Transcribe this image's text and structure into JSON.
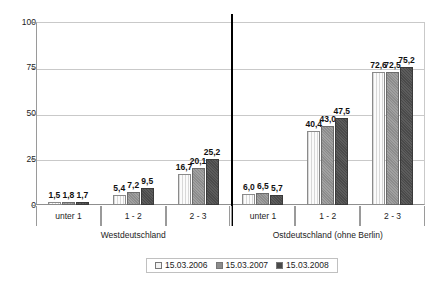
{
  "chart_data": {
    "type": "bar",
    "title": "",
    "subtitle": "",
    "xlabel": "",
    "ylabel": "",
    "ylim": [
      0,
      100
    ],
    "yticks": [
      "0",
      "25",
      "50",
      "75",
      "100"
    ],
    "grid": true,
    "legend_position": "bottom",
    "categories": [
      "unter 1",
      "1 - 2",
      "2 - 3"
    ],
    "groups": [
      {
        "name": "Westdeutschland",
        "categories": [
          "unter 1",
          "1 - 2",
          "2 - 3"
        ],
        "series": [
          {
            "name": "15.03.2006",
            "values": [
              1.5,
              5.4,
              16.7
            ],
            "labels": [
              "1,5",
              "5,4",
              "16,7"
            ]
          },
          {
            "name": "15.03.2007",
            "values": [
              1.8,
              7.2,
              20.1
            ],
            "labels": [
              "1,8",
              "7,2",
              "20,1"
            ]
          },
          {
            "name": "15.03.2008",
            "values": [
              1.7,
              9.5,
              25.2
            ],
            "labels": [
              "1,7",
              "9,5",
              "25,2"
            ]
          }
        ]
      },
      {
        "name": "Ostdeutschland (ohne Berlin)",
        "categories": [
          "unter 1",
          "1 - 2",
          "2 - 3"
        ],
        "series": [
          {
            "name": "15.03.2006",
            "values": [
              6.0,
              40.4,
              72.6
            ],
            "labels": [
              "6,0",
              "40,4",
              "72,6"
            ]
          },
          {
            "name": "15.03.2007",
            "values": [
              6.5,
              43.0,
              72.5
            ],
            "labels": [
              "6,5",
              "43,0",
              "72,5"
            ]
          },
          {
            "name": "15.03.2008",
            "values": [
              5.7,
              47.5,
              75.2
            ],
            "labels": [
              "5,7",
              "47,5",
              "75,2"
            ]
          }
        ]
      }
    ],
    "series_names": [
      "15.03.2006",
      "15.03.2007",
      "15.03.2008"
    ],
    "series_colors": [
      "#f2f2f2",
      "#8c8c8c",
      "#4a4a4a"
    ],
    "legend": [
      {
        "label": "15.03.2006",
        "color": "#f2f2f2"
      },
      {
        "label": "15.03.2007",
        "color": "#8c8c8c"
      },
      {
        "label": "15.03.2008",
        "color": "#4a4a4a"
      }
    ]
  }
}
